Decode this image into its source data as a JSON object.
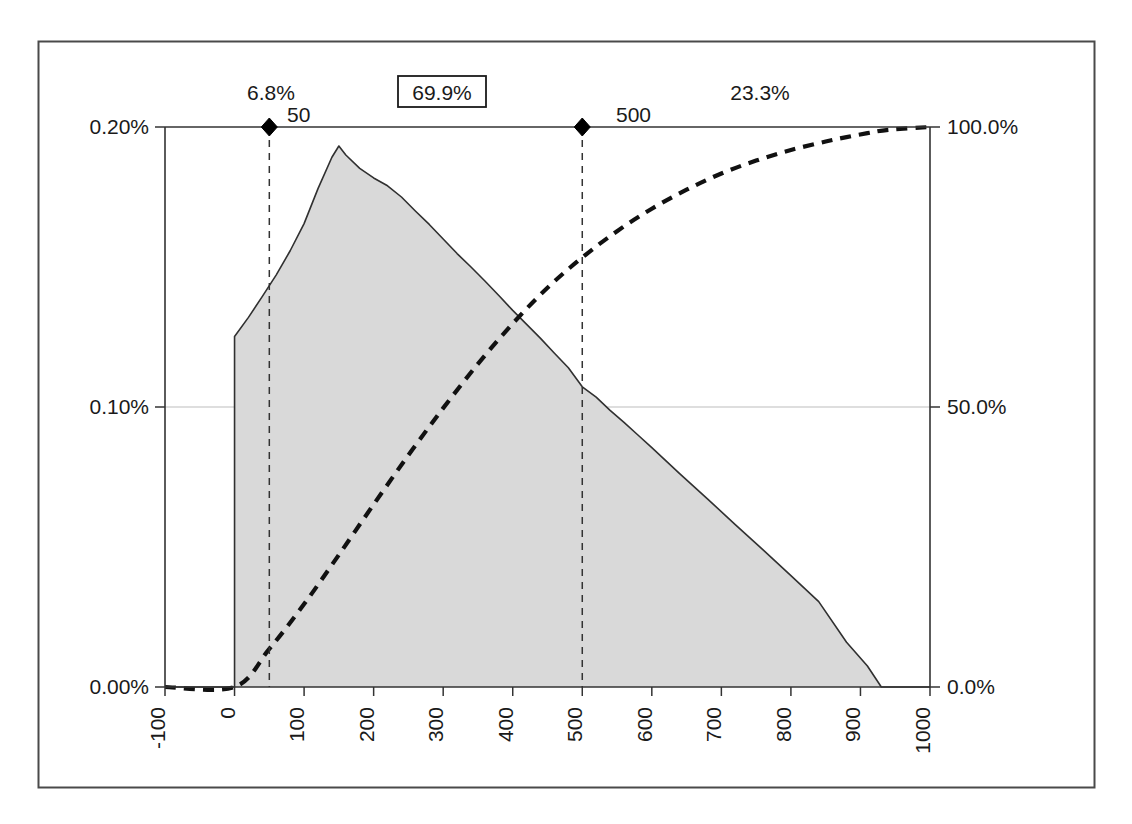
{
  "chart_data": {
    "type": "area",
    "title": "",
    "subtitle": "",
    "xlabel": "",
    "ylabel": "",
    "y2label": "",
    "xlim": [
      -100,
      1000
    ],
    "ylim": [
      0.0,
      0.2
    ],
    "y2lim": [
      0.0,
      100.0
    ],
    "grid": true,
    "legend_position": "none",
    "x_ticks": [
      -100,
      0,
      100,
      200,
      300,
      400,
      500,
      600,
      700,
      800,
      900,
      1000
    ],
    "x_tick_labels": [
      "-100",
      "0",
      "100",
      "200",
      "300",
      "400",
      "500",
      "600",
      "700",
      "800",
      "900",
      "1000"
    ],
    "y_ticks": [
      0.0,
      0.1,
      0.2
    ],
    "y_tick_labels": [
      "0.00%",
      "0.10%",
      "0.20%"
    ],
    "y2_ticks": [
      0.0,
      50.0,
      100.0
    ],
    "y2_tick_labels": [
      "0.0%",
      "50.0%",
      "100.0%"
    ],
    "series": [
      {
        "name": "probability-density",
        "type": "area",
        "axis": "left",
        "fill": "#d9d9d9",
        "stroke": "#303030",
        "x": [
          -100,
          0,
          0,
          20,
          40,
          60,
          80,
          100,
          120,
          140,
          150,
          160,
          180,
          200,
          220,
          240,
          260,
          280,
          300,
          320,
          340,
          360,
          380,
          400,
          420,
          440,
          460,
          480,
          500,
          520,
          540,
          560,
          580,
          600,
          640,
          680,
          720,
          760,
          800,
          840,
          880,
          910,
          930,
          1000
        ],
        "values": [
          0.0,
          0.0,
          0.1252,
          0.132,
          0.1395,
          0.1472,
          0.1558,
          0.1655,
          0.178,
          0.1892,
          0.1932,
          0.19,
          0.1852,
          0.1818,
          0.179,
          0.175,
          0.17,
          0.1652,
          0.16,
          0.1548,
          0.15,
          0.145,
          0.1398,
          0.1345,
          0.1295,
          0.1245,
          0.1192,
          0.114,
          0.1072,
          0.1035,
          0.0988,
          0.0945,
          0.09,
          0.0855,
          0.0762,
          0.0672,
          0.058,
          0.049,
          0.0398,
          0.0305,
          0.016,
          0.0075,
          0.0,
          0.0
        ]
      },
      {
        "name": "cumulative-probability",
        "type": "line",
        "axis": "right",
        "style": "dashed",
        "stroke": "#111111",
        "x": [
          -100,
          0,
          50,
          100,
          150,
          200,
          250,
          300,
          350,
          400,
          450,
          500,
          550,
          600,
          650,
          700,
          750,
          800,
          850,
          880,
          910,
          940,
          1000
        ],
        "values": [
          0.0,
          0.0,
          6.8,
          14.8,
          23.6,
          32.6,
          41.4,
          49.8,
          57.7,
          64.9,
          71.3,
          76.7,
          81.4,
          85.4,
          88.8,
          91.7,
          94.0,
          95.9,
          97.4,
          98.2,
          98.9,
          99.5,
          100.0
        ]
      }
    ],
    "markers": [
      {
        "name": "lower-bound-marker",
        "x": 50,
        "label": "50",
        "percent_left": "6.8%"
      },
      {
        "name": "upper-bound-marker",
        "x": 500,
        "label": "500",
        "percent_right": "23.3%"
      }
    ],
    "annotations": {
      "left_tail_percent": "6.8%",
      "center_percent": "69.9%",
      "right_tail_percent": "23.3%",
      "lower_marker_label": "50",
      "upper_marker_label": "500",
      "center_percent_boxed": true
    },
    "colors": {
      "area_fill": "#d9d9d9",
      "area_stroke": "#303030",
      "cdf_stroke": "#111111",
      "axis": "#333333",
      "gridline": "#bdbdbd",
      "marker": "#000000",
      "frame": "#4a4a4a",
      "background": "#ffffff"
    }
  },
  "frame": {
    "border_color": "#4a4a4a"
  }
}
